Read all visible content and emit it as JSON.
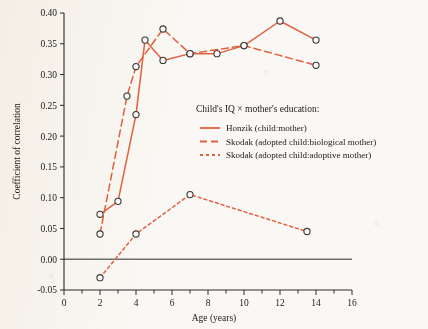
{
  "chart_data": {
    "type": "line",
    "title": "",
    "xlabel": "Age (years)",
    "ylabel": "Coefficient of correlation",
    "xlim": [
      0,
      16
    ],
    "ylim": [
      -0.05,
      0.4
    ],
    "xticks": [
      0,
      2,
      4,
      6,
      8,
      10,
      12,
      14,
      16
    ],
    "xtick_labels": [
      "0",
      "2",
      "4",
      "6",
      "8",
      "10",
      "12",
      "14",
      "16"
    ],
    "xminor_ticks": [
      1,
      3,
      5,
      7,
      9,
      11,
      13,
      15
    ],
    "yticks": [
      -0.05,
      0.0,
      0.05,
      0.1,
      0.15,
      0.2,
      0.25,
      0.3,
      0.35,
      0.4
    ],
    "ytick_labels": [
      "-0.05",
      "0.00",
      "0.05",
      "0.10",
      "0.15",
      "0.20",
      "0.25",
      "0.30",
      "0.35",
      "0.40"
    ],
    "grid": false,
    "zero_line": 0.0,
    "marker": "open-circle",
    "legend_position": "center-right",
    "legend_title": "Child's IQ × mother's education:",
    "series": [
      {
        "name": "Honzik (child:mother)",
        "style": "solid",
        "color": "#e2603f",
        "points": [
          {
            "x": 2.0,
            "y": 0.073
          },
          {
            "x": 3.0,
            "y": 0.094
          },
          {
            "x": 4.0,
            "y": 0.235
          },
          {
            "x": 4.5,
            "y": 0.356
          },
          {
            "x": 5.5,
            "y": 0.323
          },
          {
            "x": 7.0,
            "y": 0.334
          },
          {
            "x": 8.5,
            "y": 0.334
          },
          {
            "x": 10.0,
            "y": 0.347
          },
          {
            "x": 12.0,
            "y": 0.387
          },
          {
            "x": 14.0,
            "y": 0.356
          }
        ]
      },
      {
        "name": "Skodak (adopted child:biological mother)",
        "style": "dashed",
        "color": "#e2603f",
        "points": [
          {
            "x": 2.0,
            "y": 0.041
          },
          {
            "x": 3.5,
            "y": 0.265
          },
          {
            "x": 4.0,
            "y": 0.313
          },
          {
            "x": 5.5,
            "y": 0.374
          },
          {
            "x": 7.0,
            "y": 0.334
          },
          {
            "x": 10.0,
            "y": 0.347
          },
          {
            "x": 14.0,
            "y": 0.315
          }
        ]
      },
      {
        "name": "Skodak (adopted child:adoptive mother)",
        "style": "dotted",
        "color": "#e2603f",
        "points": [
          {
            "x": 2.0,
            "y": -0.03
          },
          {
            "x": 4.0,
            "y": 0.041
          },
          {
            "x": 7.0,
            "y": 0.105
          },
          {
            "x": 13.5,
            "y": 0.045
          }
        ]
      }
    ]
  },
  "legend": {
    "title": "Child's IQ × mother's education:",
    "entries": [
      {
        "label": "Honzik (child:mother)",
        "style": "solid"
      },
      {
        "label": "Skodak (adopted child:biological mother)",
        "style": "dashed"
      },
      {
        "label": "Skodak (adopted child:adoptive mother)",
        "style": "dotted"
      }
    ]
  },
  "colors": {
    "series": "#e2603f",
    "axis": "#2b2b2b",
    "zero_line": "#6f6f6f",
    "paper": "#faf8f4",
    "marker_edge": "#3a3a3a"
  }
}
